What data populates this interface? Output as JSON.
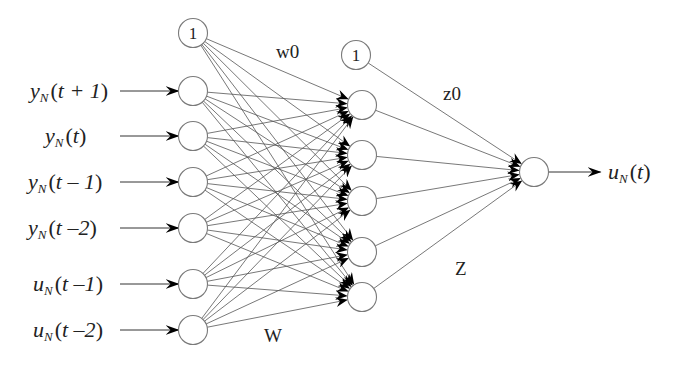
{
  "diagram": {
    "title": "",
    "type": "neural-network",
    "input_bias": {
      "label": "1",
      "x": 193,
      "y": 33
    },
    "hidden_bias": {
      "label": "1",
      "x": 356,
      "y": 55
    },
    "node_radius": 14.5,
    "inputs": [
      {
        "var": "y",
        "sub": "N",
        "arg": "t + 1",
        "x": 193,
        "y": 91,
        "label_x": 30
      },
      {
        "var": "y",
        "sub": "N",
        "arg": "t",
        "x": 193,
        "y": 136,
        "label_x": 45
      },
      {
        "var": "y",
        "sub": "N",
        "arg": "t – 1",
        "x": 193,
        "y": 182,
        "label_x": 28
      },
      {
        "var": "y",
        "sub": "N",
        "arg": "t –2",
        "x": 193,
        "y": 228,
        "label_x": 28
      },
      {
        "var": "u",
        "sub": "N",
        "arg": "t –1",
        "x": 193,
        "y": 284,
        "label_x": 33
      },
      {
        "var": "u",
        "sub": "N",
        "arg": "t –2",
        "x": 193,
        "y": 330,
        "label_x": 33
      }
    ],
    "hidden": [
      {
        "x": 362,
        "y": 105
      },
      {
        "x": 362,
        "y": 155
      },
      {
        "x": 362,
        "y": 201
      },
      {
        "x": 362,
        "y": 252
      },
      {
        "x": 362,
        "y": 297
      }
    ],
    "output": {
      "var": "u",
      "sub": "N",
      "arg": "t",
      "x": 534,
      "y": 172
    },
    "weight_labels": {
      "w0": {
        "text": "w0",
        "x": 276,
        "y": 58
      },
      "z0": {
        "text": "z0",
        "x": 443,
        "y": 100
      },
      "W": {
        "text": "W",
        "x": 264,
        "y": 342
      },
      "Z": {
        "text": "Z",
        "x": 455,
        "y": 275
      }
    },
    "colors": {
      "stroke": "#555555",
      "node_stroke": "#7a7a7a",
      "arrowhead": "#000000",
      "background": "#ffffff"
    }
  }
}
